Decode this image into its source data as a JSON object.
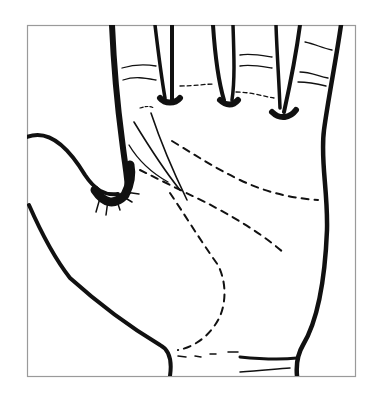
{
  "figure": {
    "frame": {
      "x": 27,
      "y": 25,
      "width": 328,
      "height": 351,
      "stroke": "#9a9a9a"
    },
    "ink_color": "#111111",
    "background": "#ffffff",
    "lines": [
      {
        "name": "heart-line",
        "style": "dashed"
      },
      {
        "name": "head-line",
        "style": "dashed"
      },
      {
        "name": "life-line",
        "style": "dashed"
      },
      {
        "name": "fate-line-1",
        "style": "solid"
      },
      {
        "name": "fate-line-2",
        "style": "solid"
      }
    ]
  }
}
